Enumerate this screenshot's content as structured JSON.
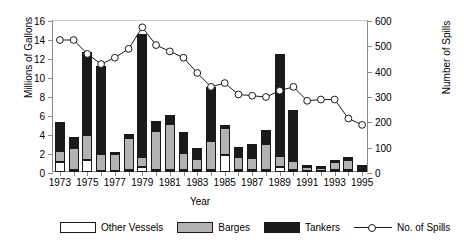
{
  "chart_data": {
    "type": "bar",
    "title": "",
    "xlabel": "Year",
    "ylabel": "Millions of Gallons",
    "ylabel_right": "Number of Spills",
    "ylim": [
      0,
      16
    ],
    "ylim_right": [
      0,
      600
    ],
    "yticks": [
      0,
      2,
      4,
      6,
      8,
      10,
      12,
      14,
      16
    ],
    "yticks_right": [
      0,
      100,
      200,
      300,
      400,
      500,
      600
    ],
    "grid": false,
    "legend_position": "bottom",
    "stacked": true,
    "categories": [
      "1973",
      "1974",
      "1975",
      "1976",
      "1977",
      "1978",
      "1979",
      "1980",
      "1981",
      "1982",
      "1983",
      "1984",
      "1985",
      "1986",
      "1987",
      "1988",
      "1989",
      "1990",
      "1991",
      "1992",
      "1993",
      "1994",
      "1995"
    ],
    "xtick_labels": [
      "1973",
      "1975",
      "1977",
      "1979",
      "1981",
      "1983",
      "1985",
      "1987",
      "1989",
      "1991",
      "1993",
      "1995"
    ],
    "series": [
      {
        "name": "Other Vessels",
        "color": "#ffffff",
        "values": [
          1.1,
          0.2,
          1.3,
          0.1,
          0.15,
          0.2,
          0.5,
          0.2,
          0.2,
          0.2,
          0.2,
          0.2,
          1.8,
          0.2,
          0.2,
          0.2,
          0.5,
          0.2,
          0.15,
          0.15,
          0.2,
          0.2,
          0.1
        ]
      },
      {
        "name": "Barges",
        "color": "#b3b3b3",
        "values": [
          1.1,
          2.3,
          2.6,
          1.8,
          1.7,
          3.4,
          1.1,
          4.1,
          4.9,
          1.8,
          1.2,
          3.1,
          2.8,
          1.4,
          1.3,
          2.8,
          1.2,
          1.0,
          0.35,
          0.3,
          0.9,
          1.1,
          0.25
        ]
      },
      {
        "name": "Tankers",
        "color": "#1a1a1a",
        "values": [
          3.1,
          1.2,
          8.7,
          9.3,
          0.2,
          0.4,
          12.9,
          1.1,
          0.9,
          2.2,
          1.1,
          5.7,
          0.3,
          1.0,
          1.4,
          1.4,
          10.7,
          5.3,
          0.1,
          0.1,
          0.2,
          0.3,
          0.35
        ]
      }
    ],
    "line_series": {
      "name": "No. of Spills",
      "marker": "circle-open",
      "color": "#1a1a1a",
      "axis": "right",
      "values": [
        525,
        525,
        470,
        430,
        455,
        490,
        575,
        505,
        480,
        455,
        395,
        340,
        355,
        310,
        305,
        300,
        325,
        340,
        285,
        290,
        290,
        215,
        190
      ]
    }
  },
  "legend": {
    "items": [
      {
        "label": "Other Vessels",
        "swatch": "other"
      },
      {
        "label": "Barges",
        "swatch": "barges"
      },
      {
        "label": "Tankers",
        "swatch": "tankers"
      },
      {
        "label": "No. of Spills",
        "swatch": "line"
      }
    ]
  }
}
